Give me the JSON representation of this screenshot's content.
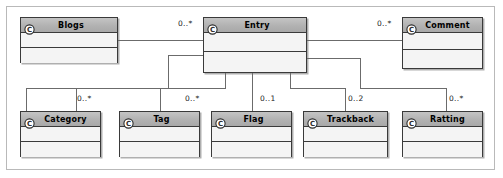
{
  "diagram": {
    "kind": "uml-class-diagram",
    "colors": {
      "header_fill": "#b2b2b2",
      "body_fill": "#f4f4f4",
      "border": "#3a3a3a",
      "connector": "#6b6b6b",
      "frame": "#b9b9b9",
      "text": "#000000"
    },
    "classes": [
      {
        "id": "blogs",
        "name": "Blogs",
        "icon": "uml-class-icon",
        "x": 20,
        "y": 17,
        "w": 98,
        "h": 46
      },
      {
        "id": "entry",
        "name": "Entry",
        "icon": "uml-class-icon",
        "x": 203,
        "y": 17,
        "w": 104,
        "h": 56
      },
      {
        "id": "comment",
        "name": "Comment",
        "icon": "uml-class-icon",
        "x": 402,
        "y": 17,
        "w": 81,
        "h": 52
      },
      {
        "id": "category",
        "name": "Category",
        "icon": "uml-class-icon",
        "x": 20,
        "y": 111,
        "w": 81,
        "h": 46
      },
      {
        "id": "tag",
        "name": "Tag",
        "icon": "uml-class-icon",
        "x": 119,
        "y": 111,
        "w": 81,
        "h": 46
      },
      {
        "id": "flag",
        "name": "Flag",
        "icon": "uml-class-icon",
        "x": 211,
        "y": 111,
        "w": 81,
        "h": 46
      },
      {
        "id": "trackback",
        "name": "Trackback",
        "icon": "uml-class-icon",
        "x": 303,
        "y": 111,
        "w": 85,
        "h": 46
      },
      {
        "id": "ratting",
        "name": "Ratting",
        "icon": "uml-class-icon",
        "x": 402,
        "y": 111,
        "w": 81,
        "h": 46
      }
    ],
    "associations": [
      {
        "id": "blogs-entry",
        "from": "blogs",
        "to": "entry",
        "multiplicity": "0..*",
        "label_x": 178,
        "label_y": 19
      },
      {
        "id": "entry-comment",
        "from": "entry",
        "to": "comment",
        "multiplicity": "0..*",
        "label_x": 377,
        "label_y": 19
      },
      {
        "id": "entry-category",
        "from": "entry",
        "to": "category",
        "multiplicity": "0..*",
        "label_x": 77,
        "label_y": 94
      },
      {
        "id": "entry-tag",
        "from": "entry",
        "to": "tag",
        "multiplicity": "0..*",
        "label_x": 185,
        "label_y": 94
      },
      {
        "id": "entry-flag",
        "from": "entry",
        "to": "flag",
        "multiplicity": "0..1",
        "label_x": 260,
        "label_y": 94
      },
      {
        "id": "entry-trackback",
        "from": "entry",
        "to": "trackback",
        "multiplicity": "0..2",
        "label_x": 348,
        "label_y": 94
      },
      {
        "id": "entry-ratting",
        "from": "entry",
        "to": "ratting",
        "multiplicity": "0..*",
        "label_x": 449,
        "label_y": 94
      }
    ]
  }
}
